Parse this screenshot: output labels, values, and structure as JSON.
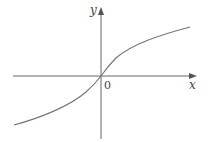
{
  "figure": {
    "x_axis_label": "x",
    "y_axis_label": "y",
    "origin_label": "0",
    "curve_description": "increasing odd function through origin, concave up for x<0, concave down for x>0 (arctan-like)"
  },
  "colors": {
    "axis": "#666666",
    "curve": "#777777",
    "background": "#ffffff"
  }
}
